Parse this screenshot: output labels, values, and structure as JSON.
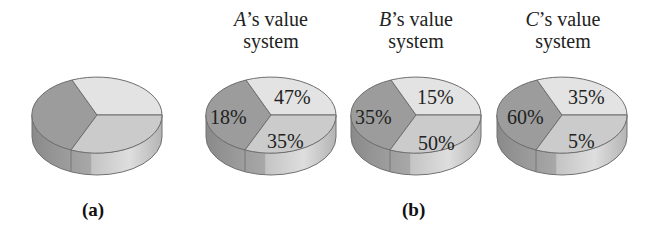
{
  "panels": {
    "a": {
      "caption": "(a)"
    },
    "b": {
      "caption": "(b)"
    }
  },
  "pies": [
    {
      "id": "a",
      "title_name": "",
      "title_rest": "",
      "title_line2": "",
      "labels": {
        "top_right": "",
        "left": "",
        "bottom_right": ""
      }
    },
    {
      "id": "A",
      "title_name": "A",
      "title_rest": "’s value",
      "title_line2": "system",
      "labels": {
        "top_right": "47%",
        "left": "18%",
        "bottom_right": "35%"
      }
    },
    {
      "id": "B",
      "title_name": "B",
      "title_rest": "’s value",
      "title_line2": "system",
      "labels": {
        "top_right": "15%",
        "left": "35%",
        "bottom_right": "50%"
      }
    },
    {
      "id": "C",
      "title_name": "C",
      "title_rest": "’s value",
      "title_line2": "system",
      "labels": {
        "top_right": "35%",
        "left": "60%",
        "bottom_right": "5%"
      }
    }
  ],
  "colors": {
    "left_slice": "#9a9a9a",
    "top_right_slice": "#e2e2e2",
    "bottom_right_slice": "#c8c8c8",
    "side_dark": "#8c8c8c",
    "side_light": "#d6d6d6",
    "edge": "#6e6e6e"
  }
}
